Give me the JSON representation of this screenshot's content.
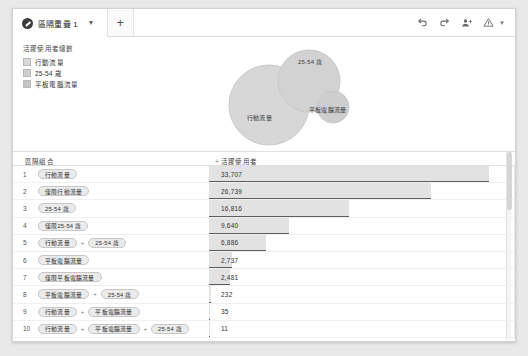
{
  "tab": {
    "title": "區隔重疊 1",
    "caret_icon": "chevron-down-icon",
    "add_label": "+"
  },
  "toolbar": {
    "undo_icon": "undo-icon",
    "redo_icon": "redo-icon",
    "share_icon": "add-person-icon",
    "warning_icon": "warning-triangle-icon",
    "caret_icon": "chevron-down-icon"
  },
  "legend": {
    "title": "活躍使用者總數",
    "items": [
      {
        "label": "行動流量",
        "color": "#d9d9d9"
      },
      {
        "label": "25-54 歲",
        "color": "#cfcfcf"
      },
      {
        "label": "平板電腦流量",
        "color": "#c4c4c4"
      }
    ]
  },
  "venn": {
    "circles": [
      {
        "name": "行動流量",
        "cx": 60,
        "cy": 66,
        "r": 40,
        "fill": "#d2d2d2"
      },
      {
        "name": "25-54 歲",
        "cx": 100,
        "cy": 42,
        "r": 31,
        "fill": "#cccccc"
      },
      {
        "name": "平板電腦流量",
        "cx": 124,
        "cy": 68,
        "r": 16,
        "fill": "#c9c9c9"
      }
    ],
    "labels": [
      {
        "text": "25-54 歲",
        "x": 92,
        "y": 22
      },
      {
        "text": "行動流量",
        "x": 42,
        "y": 78
      },
      {
        "text": "平板電腦流量",
        "x": 104,
        "y": 70
      }
    ]
  },
  "table": {
    "columns": {
      "left": "區隔組合",
      "right": "活躍使用者",
      "right_prefix": "+"
    },
    "rows": [
      {
        "n": "1",
        "chips": [
          "行動流量"
        ],
        "value": "33,707",
        "num": 33707
      },
      {
        "n": "2",
        "chips": [
          "僅限行動流量"
        ],
        "value": "26,739",
        "num": 26739
      },
      {
        "n": "3",
        "chips": [
          "25-54 歲"
        ],
        "value": "16,816",
        "num": 16816
      },
      {
        "n": "4",
        "chips": [
          "僅限25-54 歲"
        ],
        "value": "9,640",
        "num": 9640
      },
      {
        "n": "5",
        "chips": [
          "行動流量",
          "25-54 歲"
        ],
        "value": "6,886",
        "num": 6886
      },
      {
        "n": "6",
        "chips": [
          "平板電腦流量"
        ],
        "value": "2,737",
        "num": 2737
      },
      {
        "n": "7",
        "chips": [
          "僅限平板電腦流量"
        ],
        "value": "2,481",
        "num": 2481
      },
      {
        "n": "8",
        "chips": [
          "平板電腦流量",
          "25-54 歲"
        ],
        "value": "232",
        "num": 232
      },
      {
        "n": "9",
        "chips": [
          "行動流量",
          "平板電腦流量"
        ],
        "value": "35",
        "num": 35
      },
      {
        "n": "10",
        "chips": [
          "行動流量",
          "平板電腦流量",
          "25-54 歲"
        ],
        "value": "11",
        "num": 11
      }
    ],
    "max": 33707,
    "separator": "+"
  }
}
